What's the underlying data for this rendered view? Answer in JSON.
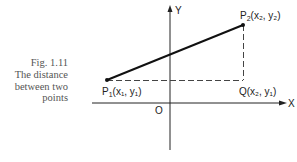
{
  "caption": {
    "figure": "Fig. 1.11",
    "line1": "The distance",
    "line2": "between two",
    "line3": "points"
  },
  "axes": {
    "x_label": "X",
    "y_label": "Y",
    "origin_label": "O"
  },
  "points": {
    "p1": {
      "name": "P",
      "sub": "1",
      "coords_label": "(x₁, y₁)"
    },
    "p2": {
      "name": "P",
      "sub": "2",
      "coords_label": "(x₂, y₂)"
    },
    "q": {
      "name": "Q",
      "coords_label": "(x₂, y₁)"
    }
  },
  "colors": {
    "ink": "#222222",
    "caption": "#555555"
  }
}
